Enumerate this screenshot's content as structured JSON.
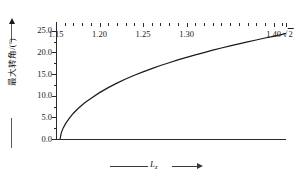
{
  "chart_data": {
    "type": "line",
    "title": "",
    "xlabel": "L_z",
    "ylabel": "最大转角/(°)",
    "xlim": [
      1.15,
      1.41421356
    ],
    "ylim": [
      0.0,
      27.0
    ],
    "grid": false,
    "legend": null,
    "x_ticks": [
      {
        "value": 1.15,
        "label": "1.15"
      },
      {
        "value": 1.2,
        "label": "1.20"
      },
      {
        "value": 1.25,
        "label": "1.25"
      },
      {
        "value": 1.3,
        "label": "1.30"
      },
      {
        "value": 1.4,
        "label": "1.40"
      },
      {
        "value": 1.41421356,
        "label": "√2"
      }
    ],
    "x_minor_step": 0.01,
    "y_ticks": [
      {
        "value": 0.0,
        "label": "0.0"
      },
      {
        "value": 5.0,
        "label": "5.0"
      },
      {
        "value": 10.0,
        "label": "10.0"
      },
      {
        "value": 15.0,
        "label": "15.0"
      },
      {
        "value": 20.0,
        "label": "20.0"
      },
      {
        "value": 25.0,
        "label": "25.0"
      }
    ],
    "y_minor_step": 2.5,
    "series": [
      {
        "name": "最大转角",
        "color": "#1a1a1a",
        "x": [
          1.1547,
          1.156,
          1.158,
          1.161,
          1.165,
          1.17,
          1.176,
          1.183,
          1.19,
          1.2,
          1.21,
          1.22,
          1.23,
          1.24,
          1.25,
          1.26,
          1.27,
          1.28,
          1.29,
          1.3,
          1.31,
          1.32,
          1.33,
          1.34,
          1.35,
          1.36,
          1.37,
          1.38,
          1.39,
          1.4,
          1.41,
          1.41421356
        ],
        "y": [
          0.0,
          1.35,
          2.45,
          3.55,
          4.7,
          5.95,
          7.15,
          8.35,
          9.35,
          10.7,
          11.85,
          12.9,
          13.85,
          14.7,
          15.5,
          16.25,
          16.95,
          17.6,
          18.25,
          18.85,
          19.4,
          19.95,
          20.5,
          21.0,
          21.5,
          21.95,
          22.4,
          22.85,
          23.3,
          23.7,
          24.15,
          24.4
        ]
      }
    ]
  },
  "axis": {
    "y_caption": "最大转角/(°)",
    "x_caption_symbol": "L",
    "x_caption_subscript": "z",
    "sqrt_label": "2"
  }
}
